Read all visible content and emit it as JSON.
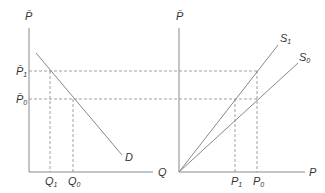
{
  "left_panel": {
    "y_axis_label": "P̄",
    "x_axis_label": "Q",
    "curve_label": "D",
    "price_labels": [
      "P̄",
      "P̄"
    ],
    "price_subs": [
      "1",
      "0"
    ],
    "quantity_labels": [
      "Q",
      "Q"
    ],
    "quantity_subs": [
      "1",
      "0"
    ]
  },
  "right_panel": {
    "y_axis_label": "P̄",
    "x_axis_label": "P",
    "curve_labels": [
      "S",
      "S"
    ],
    "curve_subs": [
      "1",
      "0"
    ],
    "price_labels": [
      "P",
      "P"
    ],
    "price_subs": [
      "1",
      "0"
    ]
  },
  "colors": {
    "line": "#888888",
    "text": "#333333"
  }
}
